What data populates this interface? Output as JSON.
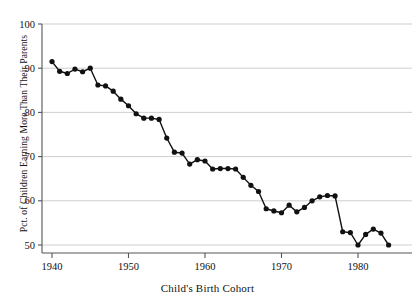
{
  "chart_data": {
    "type": "line",
    "title": "",
    "subtitle": "",
    "xlabel": "Child's Birth Cohort",
    "ylabel": "Pct. of Children Earning More Than Their Parents",
    "xlim": [
      1938.5,
      1985.5
    ],
    "ylim": [
      47.5,
      101.5
    ],
    "xticks": [
      1940,
      1950,
      1960,
      1970,
      1980
    ],
    "yticks": [
      50,
      60,
      70,
      80,
      90,
      100
    ],
    "grid": "horizontal",
    "legend": "none",
    "marker": "filled-circle",
    "line_color": "#111111",
    "marker_color": "#111111",
    "grid_color": "#c8c8c8",
    "axis_color": "#555555",
    "x": [
      1940,
      1941,
      1942,
      1943,
      1944,
      1945,
      1946,
      1947,
      1948,
      1949,
      1950,
      1951,
      1952,
      1953,
      1954,
      1955,
      1956,
      1957,
      1958,
      1959,
      1960,
      1961,
      1962,
      1963,
      1964,
      1965,
      1966,
      1967,
      1968,
      1969,
      1970,
      1971,
      1972,
      1973,
      1974,
      1975,
      1976,
      1977,
      1978,
      1979,
      1980,
      1981,
      1982,
      1983,
      1984
    ],
    "values": [
      91.5,
      89.3,
      88.8,
      89.8,
      89.2,
      90.0,
      86.2,
      86.0,
      84.8,
      83.0,
      81.5,
      79.7,
      78.7,
      78.7,
      78.4,
      74.2,
      71.0,
      70.8,
      68.3,
      69.3,
      69.0,
      67.2,
      67.3,
      67.3,
      67.2,
      65.3,
      63.5,
      62.1,
      58.2,
      57.7,
      57.3,
      59.0,
      57.5,
      58.5,
      60.0,
      60.9,
      61.2,
      61.1,
      60.6,
      59.6,
      58.4,
      59.4,
      57.0,
      55.2,
      54.3
    ],
    "values_tail": [
      53.0,
      52.8,
      50.0,
      52.4,
      53.6,
      52.7,
      50.0
    ],
    "x_tail": [
      1978,
      1979,
      1980,
      1981,
      1982,
      1983,
      1984
    ]
  },
  "axes": {
    "x_title": "Child's Birth Cohort",
    "y_title": "Pct. of Children Earning More Than Their Parents",
    "y_tick_labels": [
      "100",
      "90",
      "80",
      "70",
      "60",
      "50"
    ],
    "x_tick_labels": [
      "1940",
      "1950",
      "1960",
      "1970",
      "1980"
    ]
  }
}
